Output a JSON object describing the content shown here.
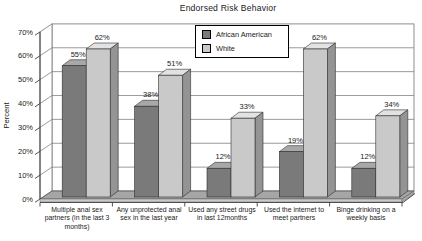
{
  "chart_data": {
    "type": "bar",
    "variant": "3d-column",
    "title": "Endorsed Risk Behavior",
    "ylabel": "Percent",
    "value_suffix": "%",
    "categories": [
      "Multiple anal sex partners (in the last 3 months)",
      "Any unprotected anal sex in the last year",
      "Used any street drugs in last 12months",
      "Used the internet to meet partners",
      "Binge drinking on a weekly basis"
    ],
    "series": [
      {
        "name": "African American",
        "values": [
          55,
          38,
          12,
          19,
          12
        ],
        "color": "#7a7a7a",
        "color_top": "#a8a8a8",
        "color_side": "#4e4e4e"
      },
      {
        "name": "White",
        "values": [
          62,
          51,
          33,
          62,
          34
        ],
        "color": "#c9c9c9",
        "color_top": "#e2e2e2",
        "color_side": "#949494"
      }
    ],
    "y_ticks": [
      "0%",
      "10%",
      "20%",
      "30%",
      "40%",
      "50%",
      "60%",
      "70%"
    ],
    "ylim": [
      0,
      70
    ],
    "y_step": 10,
    "grid": true,
    "legend_position": "top-center",
    "colors": {
      "wall": "#ffffff",
      "wall_line": "#828282",
      "floor": "#a6a6a6",
      "floor_front": "#c9c9c9",
      "axis": "#404040",
      "text": "#1a1a1a",
      "bar_outline": "#2e2e2e",
      "legend_border": "#000000",
      "legend_bg": "#ffffff"
    }
  }
}
